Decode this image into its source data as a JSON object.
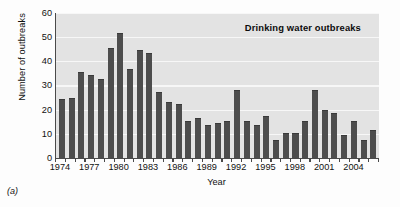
{
  "figure": {
    "panel_caption": "(a)"
  },
  "chart_data": {
    "type": "bar",
    "title": "Drinking water outbreaks",
    "xlabel": "Year",
    "ylabel": "Number of outbreaks",
    "ylim": [
      0,
      60
    ],
    "ytick_labels": [
      "0",
      "10",
      "20",
      "30",
      "40",
      "50",
      "60"
    ],
    "ytick_values": [
      0,
      10,
      20,
      30,
      40,
      50,
      60
    ],
    "xtick_labels": [
      "1974",
      "1977",
      "1980",
      "1983",
      "1986",
      "1989",
      "1992",
      "1995",
      "1998",
      "2001",
      "2004"
    ],
    "xtick_values": [
      1974,
      1977,
      1980,
      1983,
      1986,
      1989,
      1992,
      1995,
      1998,
      2001,
      2004
    ],
    "grid": true,
    "grid_axis": "y",
    "legend": false,
    "bar_color": "#4d4d4d",
    "plot_background": "#e3e3e3",
    "categories": [
      "1974",
      "1975",
      "1976",
      "1977",
      "1978",
      "1979",
      "1980",
      "1981",
      "1982",
      "1983",
      "1984",
      "1985",
      "1986",
      "1987",
      "1988",
      "1989",
      "1990",
      "1991",
      "1992",
      "1993",
      "1994",
      "1995",
      "1996",
      "1997",
      "1998",
      "1999",
      "2000",
      "2001",
      "2002",
      "2003",
      "2004",
      "2005",
      "2006"
    ],
    "values": [
      24,
      24.5,
      35,
      34,
      32,
      45,
      51,
      36.5,
      44,
      43,
      27,
      22.5,
      22,
      15,
      16,
      13,
      14,
      15,
      27.5,
      15,
      13,
      17,
      7,
      10,
      10,
      15,
      27.5,
      19.5,
      18,
      9,
      15,
      7,
      11
    ]
  }
}
